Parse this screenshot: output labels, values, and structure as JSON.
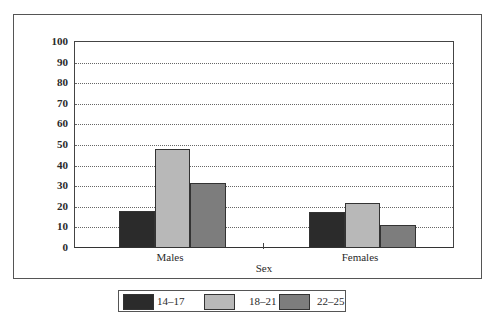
{
  "chart_data": {
    "type": "bar",
    "title": "",
    "xlabel": "Sex",
    "ylabel": "",
    "ylim": [
      0,
      100
    ],
    "yticks": [
      0,
      10,
      20,
      30,
      40,
      50,
      60,
      70,
      80,
      90,
      100
    ],
    "grid": true,
    "legend_position": "bottom",
    "categories": [
      "Males",
      "Females"
    ],
    "series": [
      {
        "name": "14–17",
        "color": "#2b2b2b",
        "values": [
          17.5,
          17
        ]
      },
      {
        "name": "18–21",
        "color": "#b8b8b8",
        "values": [
          47.5,
          21.5
        ]
      },
      {
        "name": "22–25",
        "color": "#7d7d7d",
        "values": [
          31,
          10.5
        ]
      }
    ]
  },
  "axis": {
    "x_title": "Sex",
    "y_ticks": [
      "0",
      "10",
      "20",
      "30",
      "40",
      "50",
      "60",
      "70",
      "80",
      "90",
      "100"
    ],
    "categories": [
      "Males",
      "Females"
    ]
  },
  "legend": {
    "items": [
      {
        "label": "14–17",
        "color": "#2b2b2b"
      },
      {
        "label": "18–21",
        "color": "#b8b8b8"
      },
      {
        "label": "22–25",
        "color": "#7d7d7d"
      }
    ]
  }
}
